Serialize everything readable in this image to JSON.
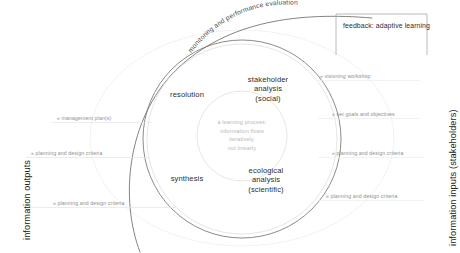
{
  "diagram": {
    "title_arc": "monitoring and performance evaluation",
    "feedback_box": "feedback: adaptive learning",
    "axis_left": "information outputs",
    "axis_right": "information inputs (stakeholders)",
    "center_note": [
      "a learning process:",
      "information flows",
      "iteratively,",
      "not linearly"
    ],
    "quadrants": [
      {
        "name": "resolution",
        "lines": [
          "resolution"
        ]
      },
      {
        "name": "stakeholder-analysis",
        "lines": [
          "stakeholder",
          "analysis",
          "(social)"
        ]
      },
      {
        "name": "synthesis",
        "lines": [
          "synthesis"
        ]
      },
      {
        "name": "ecological-analysis",
        "lines": [
          "ecological",
          "analysis",
          "(scientific)"
        ]
      }
    ],
    "outputs": [
      "management plan(s)",
      "planning and design criteria",
      "planning and design criteria"
    ],
    "inputs": [
      "visioning workshop",
      "set goals and objectives",
      "planning and design criteria",
      "planning and design criteria"
    ],
    "colors": {
      "ink": "#2e2e2e",
      "muted": "#8f8f8f",
      "faint": "#b9b9b9",
      "stroke": "#5a5a5a",
      "stroke_light": "#cfcfcf",
      "background": "#ffffff"
    }
  }
}
